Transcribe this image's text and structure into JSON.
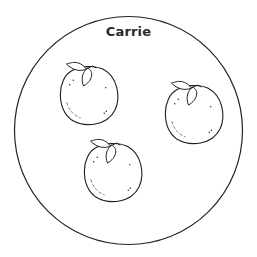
{
  "title": "Carrie",
  "circle": {
    "cx": 128.5,
    "cy": 130.5,
    "r": 114,
    "stroke": "#222222"
  },
  "oranges": [
    {
      "cx": 88,
      "cy": 95,
      "r": 29.5
    },
    {
      "cx": 193,
      "cy": 114,
      "r": 29.5
    },
    {
      "cx": 112,
      "cy": 172,
      "r": 29.5
    }
  ],
  "stroke_color": "#1e1e1e"
}
